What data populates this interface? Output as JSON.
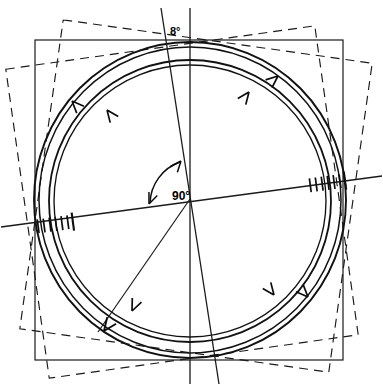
{
  "diagram": {
    "type": "technical-line-drawing",
    "background_color": "#ffffff",
    "stroke_color": "#000000",
    "canvas": {
      "width": 383,
      "height": 390
    },
    "annotations": {
      "tilt_angle_label": "8°",
      "right_angle_label": "90°"
    },
    "geometry": {
      "center": {
        "x": 190,
        "y": 199
      },
      "outer_circle_radius": 156,
      "outer_circle_inner_radius": 152,
      "inner_circle_radius": 141,
      "solid_square": {
        "x": 35,
        "y": 40,
        "width": 308,
        "height": 320,
        "rotation_deg": 0,
        "style": "solid"
      },
      "dashed_square_1": {
        "cx": 182,
        "cy": 202,
        "size": 312,
        "rotation_deg": -8,
        "style": "dashed"
      },
      "dashed_square_2": {
        "cx": 196,
        "cy": 196,
        "size": 312,
        "rotation_deg": 8,
        "style": "dashed"
      },
      "vertical_axis": {
        "x1": 190,
        "y1": 8,
        "x2": 190,
        "y2": 382,
        "style": "solid"
      },
      "tilted_axis": {
        "x1": 162,
        "y1": 8,
        "x2": 218,
        "y2": 382,
        "style": "solid",
        "tilt_deg": 8
      },
      "horizontal_axis": {
        "x1": 2,
        "y1": 226,
        "x2": 381,
        "y2": 176,
        "style": "solid",
        "tilt_deg": -7.5
      },
      "radius_line": {
        "x1": 190,
        "y1": 199,
        "x2": 99,
        "y2": 331,
        "style": "solid"
      },
      "hatch_left": {
        "x": 38,
        "y": 222,
        "count": 7
      },
      "hatch_right": {
        "x": 310,
        "y": 181,
        "count": 7
      }
    },
    "arrowheads": [
      {
        "name": "arrow-upper-left-outer",
        "x": 72,
        "y": 101,
        "angle_deg": 225,
        "arc": "outer"
      },
      {
        "name": "arrow-upper-left-inner",
        "x": 107,
        "y": 110,
        "angle_deg": 232,
        "arc": "inner"
      },
      {
        "name": "arrow-upper-right-inner",
        "x": 248,
        "y": 92,
        "angle_deg": 330,
        "arc": "inner"
      },
      {
        "name": "arrow-upper-right-outer",
        "x": 277,
        "y": 75,
        "angle_deg": 325,
        "arc": "outer"
      },
      {
        "name": "arrow-lower-left-outer",
        "x": 104,
        "y": 331,
        "angle_deg": 124,
        "arc": "outer"
      },
      {
        "name": "arrow-lower-left-inner",
        "x": 132,
        "y": 310,
        "angle_deg": 112,
        "arc": "inner"
      },
      {
        "name": "arrow-lower-right-inner",
        "x": 273,
        "y": 294,
        "angle_deg": 52,
        "arc": "inner"
      },
      {
        "name": "arrow-lower-right-outer",
        "x": 307,
        "y": 297,
        "angle_deg": 45,
        "arc": "outer"
      }
    ]
  }
}
